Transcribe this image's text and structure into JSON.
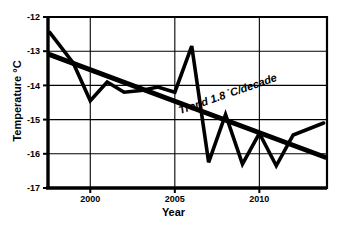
{
  "chart_data": {
    "type": "line",
    "title": "",
    "xlabel": "Year",
    "ylabel": "Temperature °C",
    "xlim": [
      1997.5,
      2014.0
    ],
    "ylim": [
      -17,
      -12
    ],
    "grid": true,
    "legend": false,
    "xticks": [
      2000,
      2005,
      2010
    ],
    "xtick_labels": [
      "2000",
      "2005",
      "2010"
    ],
    "yticks": [
      -12,
      -13,
      -14,
      -15,
      -16,
      -17
    ],
    "ytick_labels": [
      "-12",
      "-13",
      "-14",
      "-15",
      "-16",
      "-17"
    ],
    "series": [
      {
        "name": "Temperature",
        "x": [
          1997.6,
          1999.0,
          2000.0,
          2001.0,
          2002.0,
          2003.0,
          2004.0,
          2005.0,
          2006.0,
          2007.0,
          2008.0,
          2009.0,
          2010.0,
          2011.0,
          2012.0,
          2013.8
        ],
        "values": [
          -12.45,
          -13.35,
          -14.45,
          -13.9,
          -14.2,
          -14.15,
          -14.05,
          -14.2,
          -12.85,
          -16.25,
          -14.85,
          -16.3,
          -15.4,
          -16.35,
          -15.45,
          -15.1
        ]
      },
      {
        "name": "Trend",
        "x": [
          1997.6,
          2013.9
        ],
        "values": [
          -13.1,
          -16.1
        ]
      }
    ],
    "annotations": [
      {
        "text": "Trend 1.8 °C/decade",
        "text_parts": [
          "Trend 1.8 ",
          "°",
          "C/decade"
        ],
        "x": 2008.2,
        "y": -14.35,
        "rotation": -19
      }
    ]
  },
  "axis": {
    "ylabel": "Temperature °C",
    "xlabel": "Year"
  }
}
